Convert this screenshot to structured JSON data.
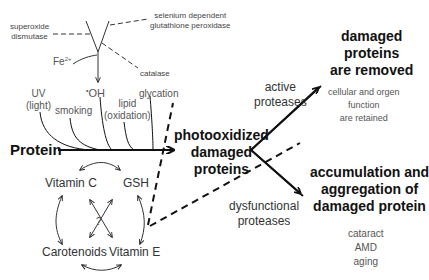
{
  "diagram": {
    "top_labels": {
      "superoxide_dismutase": [
        "superoxide",
        "dismutase"
      ],
      "selenium_gpx": [
        "selenium dependent",
        "glutathione peroxidase"
      ],
      "catalase": "catalase",
      "fe": "Fe",
      "fe_sup": "2+",
      "hydroxyl": "OH",
      "hydroxyl_dot": "•"
    },
    "stressors": {
      "uv": [
        "UV",
        "(light)"
      ],
      "smoking": "smoking",
      "lipid": [
        "lipid",
        "(oxidation)"
      ],
      "glycation": "glycation"
    },
    "protein": "Protein",
    "center": [
      "photooxidized",
      "damaged",
      "proteins"
    ],
    "active_proteases": [
      "active",
      "proteases"
    ],
    "dysfunctional_proteases": [
      "dysfunctional",
      "proteases"
    ],
    "outcome_removed": {
      "title": [
        "damaged",
        "proteins",
        "are removed"
      ],
      "detail": [
        "cellular and orgen",
        "function",
        "are retained"
      ]
    },
    "outcome_accumulation": {
      "title": [
        "accumulation and",
        "aggregation of",
        "damaged protein"
      ],
      "detail": [
        "cataract",
        "AMD",
        "aging"
      ]
    },
    "antioxidants": {
      "vitamin_c": "Vitamin C",
      "gsh": "GSH",
      "carotenoids": "Carotenoids",
      "vitamin_e": "Vitamin E",
      "unknown": "?"
    }
  }
}
